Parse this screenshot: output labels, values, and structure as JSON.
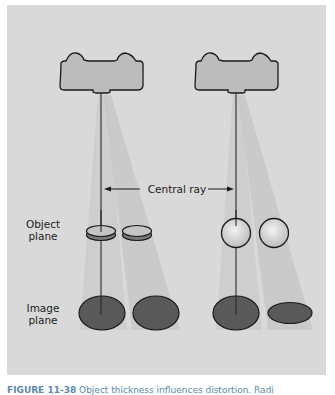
{
  "figure": {
    "labels": {
      "central_ray": "Central ray",
      "object_plane_line1": "Object",
      "object_plane_line2": "plane",
      "image_plane_line1": "Image",
      "image_plane_line2": "plane"
    },
    "caption": {
      "number": "FIGURE 11-38",
      "text": "Object thickness influences distortion. Radi"
    },
    "left_setup": {
      "object_shape": "flat-disc",
      "objects": [
        "disc-on-central-ray",
        "disc-off-axis"
      ],
      "images": [
        "ellipse-on-central-ray",
        "ellipse-off-axis"
      ]
    },
    "right_setup": {
      "object_shape": "sphere",
      "objects": [
        "sphere-on-central-ray",
        "sphere-off-axis"
      ],
      "images": [
        "ellipse-on-central-ray",
        "flattened-ellipse-off-axis"
      ]
    },
    "colors": {
      "panel_bg": "#d9d9d9",
      "beam": "#c8c8c8",
      "tube": "#b9b9b9",
      "image_fill": "#595959",
      "caption": "#5a8ab0"
    }
  }
}
